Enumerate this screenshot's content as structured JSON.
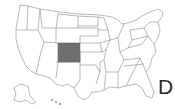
{
  "map": {
    "region": "United States",
    "highlighted_state": "Colorado",
    "highlight_color": "#6f6f6f",
    "border_color": "#8a8a8a",
    "background": "#ffffff"
  },
  "label": {
    "partial_text": "D"
  }
}
